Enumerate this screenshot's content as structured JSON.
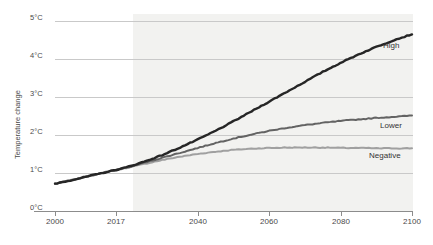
{
  "chart_data": {
    "type": "line",
    "title": "",
    "subtitle": "",
    "xlabel": "",
    "ylabel": "Temperature change",
    "xlim": [
      2000,
      2100
    ],
    "ylim": [
      0,
      5
    ],
    "grid": true,
    "legend_position": "inline-right-end",
    "x_ticks": [
      2000,
      2017,
      2040,
      2060,
      2080,
      2100
    ],
    "x_tick_labels": [
      "2000",
      "2017",
      "2040",
      "2060",
      "2080",
      "2100"
    ],
    "y_ticks": [
      0,
      1,
      2,
      3,
      4,
      5
    ],
    "y_tick_labels": [
      "0°C",
      "1°C",
      "2°C",
      "3°C",
      "4°C",
      "5°C"
    ],
    "annotations": [
      {
        "text": "projection shading begins",
        "x": 2017
      }
    ],
    "x": [
      2000,
      2005,
      2010,
      2017,
      2020,
      2025,
      2030,
      2035,
      2040,
      2045,
      2050,
      2055,
      2060,
      2065,
      2070,
      2075,
      2080,
      2085,
      2090,
      2095,
      2100
    ],
    "series": [
      {
        "name": "High",
        "color": "#262626",
        "values": [
          0.72,
          0.82,
          0.93,
          1.08,
          1.15,
          1.3,
          1.47,
          1.67,
          1.88,
          2.11,
          2.36,
          2.62,
          2.88,
          3.14,
          3.4,
          3.66,
          3.9,
          4.12,
          4.32,
          4.5,
          4.65
        ]
      },
      {
        "name": "Lower",
        "color": "#636363",
        "values": [
          0.72,
          0.82,
          0.93,
          1.08,
          1.14,
          1.27,
          1.4,
          1.53,
          1.66,
          1.79,
          1.91,
          2.01,
          2.11,
          2.19,
          2.26,
          2.32,
          2.37,
          2.41,
          2.45,
          2.48,
          2.51
        ]
      },
      {
        "name": "Negative",
        "color": "#a0a0a0",
        "values": [
          0.72,
          0.82,
          0.93,
          1.08,
          1.13,
          1.24,
          1.34,
          1.43,
          1.5,
          1.56,
          1.61,
          1.64,
          1.66,
          1.67,
          1.67,
          1.67,
          1.66,
          1.66,
          1.65,
          1.65,
          1.65
        ]
      }
    ]
  },
  "axis": {
    "y_title": "Temperature change",
    "y_labels": [
      "5°C",
      "4°C",
      "3°C",
      "2°C",
      "1°C",
      "0°C"
    ],
    "x_labels": [
      "2000",
      "2017",
      "2040",
      "2060",
      "2080",
      "2100"
    ]
  },
  "labels": {
    "high": "High",
    "lower": "Lower",
    "negative": "Negative"
  },
  "colors": {
    "high": "#262626",
    "lower": "#636363",
    "negative": "#a0a0a0",
    "grid": "#c9c9c9",
    "axis": "#8c8c8c",
    "shade": "#f2f2f0",
    "background": "#ffffff",
    "text": "#4a4a4a"
  }
}
